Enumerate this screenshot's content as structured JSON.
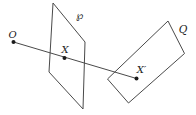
{
  "figure": {
    "background": "#ffffff",
    "stroke_color": "#4a4a4a",
    "dot_color": "#1a1a1a",
    "label_color": "#222222",
    "planes": [
      {
        "label": "℘",
        "points": "53,3 85,42 83,109 49,72",
        "label_x": "80",
        "label_y": "19"
      },
      {
        "label": "Q",
        "points": "168,21 184.5,53.5 128.5,103 107.5,79",
        "label_x": "183",
        "label_y": "33"
      }
    ],
    "ray": {
      "x1": "13.5",
      "y1": "42",
      "x2": "136.5",
      "y2": "78.5"
    },
    "points": [
      {
        "label": "O",
        "x": "13.5",
        "y": "42",
        "label_x": "12.5",
        "label_y": "37.5"
      },
      {
        "label": "X",
        "x": "64.5",
        "y": "58",
        "label_x": "65",
        "label_y": "53"
      },
      {
        "label": "X′",
        "x": "136.5",
        "y": "78.5",
        "label_x": "141.5",
        "label_y": "72.5"
      }
    ]
  }
}
